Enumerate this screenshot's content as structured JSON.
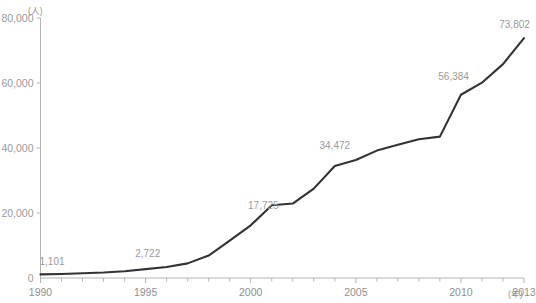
{
  "chart_data": {
    "type": "line",
    "title": "",
    "xlabel": "(年)",
    "ylabel": "(人)",
    "x": [
      1990,
      1991,
      1992,
      1993,
      1994,
      1995,
      1996,
      1997,
      1998,
      1999,
      2000,
      2001,
      2002,
      2003,
      2004,
      2005,
      2006,
      2007,
      2008,
      2009,
      2010,
      2011,
      2012,
      2013
    ],
    "values": [
      1101,
      1250,
      1450,
      1700,
      2100,
      2722,
      3400,
      4500,
      6900,
      11500,
      16200,
      22400,
      22900,
      27500,
      34472,
      36300,
      39200,
      41000,
      42700,
      43500,
      56384,
      60100,
      65800,
      73802
    ],
    "xlim": [
      1990,
      2013
    ],
    "ylim": [
      0,
      80000
    ],
    "yticks": [
      0,
      20000,
      40000,
      60000,
      80000
    ],
    "ytick_labels": [
      "0",
      "20,000",
      "40,000",
      "60,000",
      "80,000"
    ],
    "xticks": [
      1990,
      1995,
      2000,
      2005,
      2010,
      2013
    ],
    "xtick_labels": [
      "1990",
      "1995",
      "2000",
      "2005",
      "2010",
      "2013"
    ],
    "minor_xticks_every": 1,
    "grid": false,
    "legend": "none",
    "line_color": "#333333",
    "axis_color": "#b3b3b3",
    "label_color": "#9a9a9a",
    "annotations": [
      {
        "x": 1990,
        "y": 1101,
        "text": "1,101",
        "label_x": 1990.55,
        "label_y": 5300
      },
      {
        "x": 1995,
        "y": 2722,
        "text": "2,722",
        "label_x": 1995.1,
        "label_y": 7800
      },
      {
        "x": 2001,
        "y": 17725,
        "text": "17,725",
        "label_x": 2000.6,
        "label_y": 22400
      },
      {
        "x": 2004,
        "y": 34472,
        "text": "34,472",
        "label_x": 2004.0,
        "label_y": 40800
      },
      {
        "x": 2010,
        "y": 56384,
        "text": "56,384",
        "label_x": 2009.65,
        "label_y": 62200
      },
      {
        "x": 2013,
        "y": 73802,
        "text": "73,802",
        "label_x": 2012.55,
        "label_y": 78200
      }
    ]
  }
}
